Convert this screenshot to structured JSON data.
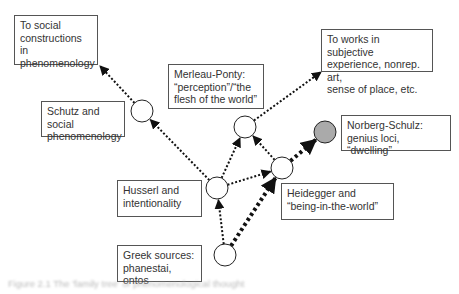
{
  "diagram": {
    "boxes": [
      {
        "id": "social",
        "text": "To social\nconstructions in\nphenomenology"
      },
      {
        "id": "works",
        "text": "To works in subjective\nexperience, nonrep. art,\nsense of place, etc."
      },
      {
        "id": "merleau",
        "text": "Merleau-Ponty:\n“perception”/“the\nflesh of the world”"
      },
      {
        "id": "schutz",
        "text": "Schutz and social\nphenomenology"
      },
      {
        "id": "norberg",
        "text": "Norberg-Schulz:\ngenius loci, “dwelling”"
      },
      {
        "id": "husserl",
        "text": "Husserl and\nintentionality"
      },
      {
        "id": "heidegger",
        "text": "Heidegger and\n“being-in-the-world”"
      },
      {
        "id": "greek",
        "text": "Greek sources:\nphanestai, ontos"
      }
    ],
    "nodes": [
      {
        "id": "n-greek",
        "label": "Greek sources",
        "fill": "#ffffff"
      },
      {
        "id": "n-husserl",
        "label": "Husserl",
        "fill": "#ffffff"
      },
      {
        "id": "n-schutz",
        "label": "Schutz",
        "fill": "#ffffff"
      },
      {
        "id": "n-merleau",
        "label": "Merleau-Ponty",
        "fill": "#ffffff"
      },
      {
        "id": "n-heidegger",
        "label": "Heidegger",
        "fill": "#ffffff"
      },
      {
        "id": "n-norberg",
        "label": "Norberg-Schulz",
        "fill": "#aaaaaa"
      }
    ],
    "edges": [
      {
        "from": "n-greek",
        "to": "n-husserl",
        "style": "dotted"
      },
      {
        "from": "n-greek",
        "to": "n-heidegger",
        "style": "heavy-dotted"
      },
      {
        "from": "n-husserl",
        "to": "n-schutz",
        "style": "dotted"
      },
      {
        "from": "n-husserl",
        "to": "n-merleau",
        "style": "dotted"
      },
      {
        "from": "n-husserl",
        "to": "n-heidegger",
        "style": "dotted"
      },
      {
        "from": "n-heidegger",
        "to": "n-merleau",
        "style": "dotted"
      },
      {
        "from": "n-heidegger",
        "to": "n-norberg",
        "style": "heavy-dotted"
      },
      {
        "from": "n-schutz",
        "to": "social",
        "style": "dotted"
      },
      {
        "from": "n-merleau",
        "to": "works",
        "style": "dotted"
      }
    ]
  },
  "caption": "Figure 2.1  The 'family tree' of phenomenological thought"
}
